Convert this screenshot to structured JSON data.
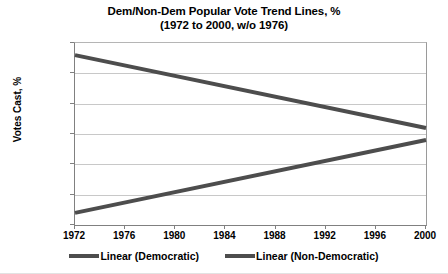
{
  "chart_data": {
    "type": "line",
    "title": "Dem/Non-Dem Popular Vote Trend Lines, %",
    "subtitle": "(1972 to 2000, w/o 1976)",
    "xlabel": "",
    "ylabel": "Votes Cast, %",
    "x": [
      1972,
      1976,
      1980,
      1984,
      1988,
      1992,
      1996,
      2000
    ],
    "xtick_labels": [
      "1972",
      "1976",
      "1980",
      "1984",
      "1988",
      "1992",
      "1996",
      "2000"
    ],
    "xlim": [
      1972,
      2000
    ],
    "ylim": [
      35,
      65
    ],
    "ytick_labels": [
      "35",
      "40",
      "45",
      "50",
      "55",
      "60",
      "65"
    ],
    "ytick_values": [
      35,
      40,
      45,
      50,
      55,
      60,
      65
    ],
    "grid": true,
    "legend_position": "bottom",
    "series": [
      {
        "name": "Linear (Democratic)",
        "color": "#4d4d4d",
        "endpoints": [
          {
            "x": 1972,
            "y": 37.0
          },
          {
            "x": 2000,
            "y": 49.0
          }
        ]
      },
      {
        "name": "Linear (Non-Democratic)",
        "color": "#4d4d4d",
        "endpoints": [
          {
            "x": 1972,
            "y": 63.0
          },
          {
            "x": 2000,
            "y": 51.0
          }
        ]
      }
    ]
  }
}
